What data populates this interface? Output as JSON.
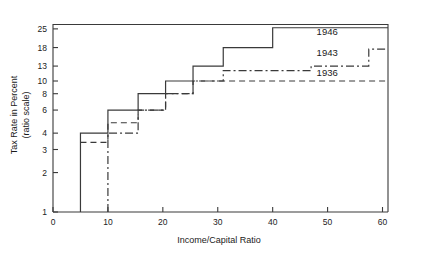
{
  "chart_data": {
    "type": "line",
    "title": "",
    "xlabel": "Income/Capital Ratio",
    "ylabel": "Tax Rate in Percent (ratio scale)",
    "ylabel_line1": "Tax Rate in Percent",
    "ylabel_line2": "(ratio scale)",
    "yscale": "log",
    "xscale": "linear",
    "xlim": [
      0,
      61
    ],
    "ylim": [
      1,
      27
    ],
    "grid": false,
    "legend_position": "inline-right",
    "xticks": [
      0,
      10,
      20,
      30,
      40,
      50,
      60
    ],
    "xticklabels": [
      "0",
      "10",
      "20",
      "30",
      "40",
      "50",
      "60"
    ],
    "yticks": [
      1,
      2,
      3,
      4,
      6,
      8,
      10,
      13,
      18,
      25
    ],
    "yticklabels": [
      "1",
      "2",
      "3",
      "4",
      "6",
      "8",
      "10",
      "13",
      "18",
      "25"
    ],
    "series": [
      {
        "name": "1936",
        "label": "1936",
        "style": "dashed",
        "label_x": 48,
        "label_y": 10.9,
        "steps": [
          {
            "x": 5,
            "y": 3.4
          },
          {
            "x": 10,
            "y": 3.4
          },
          {
            "x": 10,
            "y": 4.8
          },
          {
            "x": 15.5,
            "y": 4.8
          },
          {
            "x": 15.5,
            "y": 6.0
          },
          {
            "x": 20.5,
            "y": 6.0
          },
          {
            "x": 20.5,
            "y": 8.0
          },
          {
            "x": 25.5,
            "y": 8.0
          },
          {
            "x": 25.5,
            "y": 10.0
          },
          {
            "x": 61,
            "y": 10.0
          }
        ]
      },
      {
        "name": "1943",
        "label": "1943",
        "style": "dashdot",
        "label_x": 48,
        "label_y": 15.5,
        "steps": [
          {
            "x": 10,
            "y": 1.0
          },
          {
            "x": 10,
            "y": 4.0
          },
          {
            "x": 15.5,
            "y": 4.0
          },
          {
            "x": 15.5,
            "y": 6.0
          },
          {
            "x": 20.5,
            "y": 6.0
          },
          {
            "x": 20.5,
            "y": 8.0
          },
          {
            "x": 25.5,
            "y": 8.0
          },
          {
            "x": 25.5,
            "y": 10.0
          },
          {
            "x": 31,
            "y": 10.0
          },
          {
            "x": 31,
            "y": 12.0
          },
          {
            "x": 47,
            "y": 12.0
          },
          {
            "x": 47,
            "y": 13.0
          },
          {
            "x": 57.5,
            "y": 13.0
          },
          {
            "x": 57.5,
            "y": 17.5
          },
          {
            "x": 61,
            "y": 17.5
          }
        ]
      },
      {
        "name": "1946",
        "label": "1946",
        "style": "solid",
        "label_x": 48,
        "label_y": 22.5,
        "steps": [
          {
            "x": 5,
            "y": 1.0
          },
          {
            "x": 5,
            "y": 4.0
          },
          {
            "x": 10,
            "y": 4.0
          },
          {
            "x": 10,
            "y": 6.0
          },
          {
            "x": 15.5,
            "y": 6.0
          },
          {
            "x": 15.5,
            "y": 8.0
          },
          {
            "x": 20.5,
            "y": 8.0
          },
          {
            "x": 20.5,
            "y": 10.0
          },
          {
            "x": 25.5,
            "y": 10.0
          },
          {
            "x": 25.5,
            "y": 13.0
          },
          {
            "x": 31,
            "y": 13.0
          },
          {
            "x": 31,
            "y": 18.0
          },
          {
            "x": 40,
            "y": 18.0
          },
          {
            "x": 40,
            "y": 25.5
          },
          {
            "x": 61,
            "y": 25.5
          }
        ]
      }
    ]
  },
  "colors": {
    "line": "#3a3a3a",
    "text": "#1a1a1a",
    "background": "#ffffff"
  }
}
